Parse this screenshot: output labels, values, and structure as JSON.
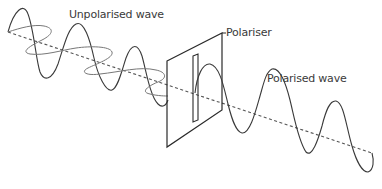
{
  "labels": {
    "unpolarised": "Unpolarised wave",
    "polariser": "Polariser",
    "polarised": "Polarised wave"
  },
  "colors": {
    "line": "#3a3a3a",
    "axis": "#555555",
    "background": "#ffffff"
  }
}
